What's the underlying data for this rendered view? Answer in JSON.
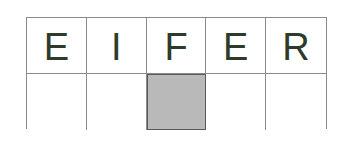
{
  "puzzle": {
    "top_row": [
      "E",
      "I",
      "F",
      "E",
      "R"
    ],
    "bottom_row": [
      "",
      "",
      "",
      "",
      ""
    ],
    "shaded_index": 2,
    "colors": {
      "letter": "#2e3b2a",
      "shaded": "#b9b9b9",
      "border": "#8a8a8a"
    }
  }
}
